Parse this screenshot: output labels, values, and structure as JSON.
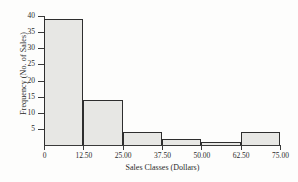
{
  "chart_data": {
    "type": "bar",
    "title": "",
    "xlabel": "Sales Classes (Dollars)",
    "ylabel": "Frequency (No. of Sales)",
    "xlim": [
      0,
      75
    ],
    "ylim": [
      0,
      40
    ],
    "grid": false,
    "legend": null,
    "bin_width": 12.5,
    "bin_edges": [
      0,
      12.5,
      25,
      37.5,
      50,
      62.5,
      75
    ],
    "categories": [
      "0-12.50",
      "12.50-25.00",
      "25.00-37.50",
      "37.50-50.00",
      "50.00-62.50",
      "62.50-75.00"
    ],
    "values": [
      39,
      14,
      4,
      2,
      1,
      4
    ],
    "xticks": [
      {
        "value": 0,
        "label": "0"
      },
      {
        "value": 12.5,
        "label": "12.50"
      },
      {
        "value": 25,
        "label": "25.00"
      },
      {
        "value": 37.5,
        "label": "37.50"
      },
      {
        "value": 50,
        "label": "50.00"
      },
      {
        "value": 62.5,
        "label": "62.50"
      },
      {
        "value": 75,
        "label": "75.00"
      }
    ],
    "yticks": [
      {
        "value": 5,
        "label": "5"
      },
      {
        "value": 10,
        "label": "10"
      },
      {
        "value": 15,
        "label": "15"
      },
      {
        "value": 20,
        "label": "20"
      },
      {
        "value": 25,
        "label": "25"
      },
      {
        "value": 30,
        "label": "30"
      },
      {
        "value": 35,
        "label": "35"
      },
      {
        "value": 40,
        "label": "40"
      }
    ],
    "colors": {
      "bar_fill": "#e7e7e4",
      "bar_edge": "#2e2e2e",
      "axis": "#3a3a3a",
      "text": "#2b2b2b",
      "background": "#fdfdfc"
    }
  }
}
